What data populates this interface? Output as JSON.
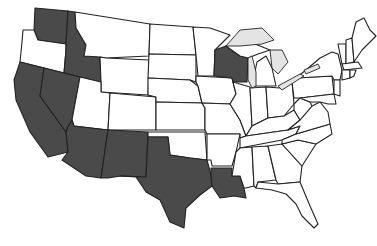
{
  "map": {
    "title": "",
    "colors": {
      "highlighted": "#4a4a4a",
      "default": "#ffffff",
      "border": "#222222",
      "lakes": "#e4e4e4"
    },
    "highlighted_states": [
      "Washington",
      "Idaho",
      "California",
      "Nevada",
      "Arizona",
      "New Mexico",
      "Texas",
      "Louisiana",
      "Wisconsin"
    ],
    "states": [
      {
        "id": "WA",
        "name": "Washington",
        "highlighted": true,
        "points": "35,8 68,11 66,44 38,40 34,30"
      },
      {
        "id": "OR",
        "name": "Oregon",
        "highlighted": false,
        "points": "23,30 34,30 38,40 66,44 66,50 64,73 20,62 22,42"
      },
      {
        "id": "ID",
        "name": "Idaho",
        "highlighted": true,
        "points": "68,11 75,12 76,28 86,45 84,56 100,57 101,82 64,73 66,50 66,44"
      },
      {
        "id": "MT",
        "name": "Montana",
        "highlighted": false,
        "points": "75,12 150,24 149,56 106,58 100,57 84,56 86,45 76,28"
      },
      {
        "id": "WY",
        "name": "Wyoming",
        "highlighted": false,
        "points": "106,58 149,60 148,95 101,92 101,82 100,57"
      },
      {
        "id": "CA",
        "name": "California",
        "highlighted": true,
        "points": "20,62 44,68 40,96 66,132 68,152 48,157 30,132 16,100 14,80"
      },
      {
        "id": "NV",
        "name": "Nevada",
        "highlighted": true,
        "points": "44,68 80,77 72,120 68,127 66,132 40,96"
      },
      {
        "id": "UT",
        "name": "Utah",
        "highlighted": false,
        "points": "80,77 101,82 101,92 110,93 108,130 74,126 72,120"
      },
      {
        "id": "CO",
        "name": "Colorado",
        "highlighted": false,
        "points": "110,93 156,97 156,130 108,130"
      },
      {
        "id": "AZ",
        "name": "Arizona",
        "highlighted": true,
        "points": "74,126 108,130 101,178 86,176 62,160 68,152 66,132 68,127 72,120"
      },
      {
        "id": "NM",
        "name": "New Mexico",
        "highlighted": true,
        "points": "108,130 148,132 146,177 121,176 108,178 101,178"
      },
      {
        "id": "ND",
        "name": "North Dakota",
        "highlighted": false,
        "points": "150,24 193,27 196,55 149,54"
      },
      {
        "id": "SD",
        "name": "South Dakota",
        "highlighted": false,
        "points": "149,54 196,55 196,82 190,80 148,78"
      },
      {
        "id": "NE",
        "name": "Nebraska",
        "highlighted": false,
        "points": "148,78 190,80 198,86 202,103 156,102 156,97 148,95"
      },
      {
        "id": "KS",
        "name": "Kansas",
        "highlighted": false,
        "points": "156,102 202,103 205,108 205,130 156,130"
      },
      {
        "id": "OK",
        "name": "Oklahoma",
        "highlighted": false,
        "points": "148,132 205,132 207,160 190,158 170,155 168,137 148,137"
      },
      {
        "id": "TX",
        "name": "Texas",
        "highlighted": true,
        "points": "148,137 168,137 170,155 190,158 207,160 211,175 212,186 200,195 186,208 184,228 170,222 160,200 146,192 136,177 121,176 146,177"
      },
      {
        "id": "MN",
        "name": "Minnesota",
        "highlighted": false,
        "points": "193,27 210,28 230,35 215,50 214,76 198,76 196,55"
      },
      {
        "id": "IA",
        "name": "Iowa",
        "highlighted": false,
        "points": "196,76 232,78 236,94 230,104 202,103 198,86 196,82"
      },
      {
        "id": "MO",
        "name": "Missouri",
        "highlighted": false,
        "points": "202,103 230,104 240,120 246,136 240,138 240,134 207,134 205,130 205,108"
      },
      {
        "id": "AR",
        "name": "Arkansas",
        "highlighted": false,
        "points": "207,134 240,134 236,152 232,166 212,166 211,160 207,160"
      },
      {
        "id": "LA",
        "name": "Louisiana",
        "highlighted": true,
        "points": "211,168 232,168 232,176 240,176 244,188 246,198 234,196 220,198 212,186 211,175"
      },
      {
        "id": "WI",
        "name": "Wisconsin",
        "highlighted": true,
        "points": "215,50 226,46 240,56 248,58 247,82 233,82 232,78 214,76"
      },
      {
        "id": "IL",
        "name": "Illinois",
        "highlighted": false,
        "points": "233,82 250,87 252,126 246,136 240,120 230,104 236,94"
      },
      {
        "id": "MI",
        "name": "Michigan",
        "highlighted": false,
        "points": "252,86 257,62 266,56 272,68 276,86"
      },
      {
        "id": "MI_UP",
        "name": "Michigan (Upper)",
        "highlighted": false,
        "points": "226,46 240,40 255,44 270,50 258,54 248,58 240,56"
      },
      {
        "id": "IN",
        "name": "Indiana",
        "highlighted": false,
        "points": "250,88 266,87 268,118 252,126"
      },
      {
        "id": "OH",
        "name": "Ohio",
        "highlighted": false,
        "points": "266,87 280,88 292,82 294,104 284,116 268,118"
      },
      {
        "id": "KY",
        "name": "Kentucky",
        "highlighted": false,
        "points": "252,126 268,118 284,116 294,110 300,120 288,130 246,136"
      },
      {
        "id": "TN",
        "name": "Tennessee",
        "highlighted": false,
        "points": "240,138 246,136 288,130 300,126 296,134 282,140 240,148"
      },
      {
        "id": "MS",
        "name": "Mississippi",
        "highlighted": false,
        "points": "240,148 252,147 254,186 246,188 244,188 240,176 232,176 236,152"
      },
      {
        "id": "AL",
        "name": "Alabama",
        "highlighted": false,
        "points": "252,147 268,146 276,180 258,182 256,188 254,186"
      },
      {
        "id": "GA",
        "name": "Georgia",
        "highlighted": false,
        "points": "268,146 282,144 302,166 300,182 278,184 276,180"
      },
      {
        "id": "FL",
        "name": "Florida",
        "highlighted": false,
        "points": "256,188 258,182 278,184 300,182 310,206 318,224 314,228 302,216 296,204 286,194 272,190"
      },
      {
        "id": "SC",
        "name": "South Carolina",
        "highlighted": false,
        "points": "282,144 298,140 316,144 302,166"
      },
      {
        "id": "NC",
        "name": "North Carolina",
        "highlighted": false,
        "points": "282,140 296,134 330,124 332,134 316,144 298,140 282,144"
      },
      {
        "id": "VA",
        "name": "Virginia",
        "highlighted": false,
        "points": "288,130 300,120 312,106 320,102 328,112 330,124 296,134 300,126"
      },
      {
        "id": "WV",
        "name": "West Virginia",
        "highlighted": false,
        "points": "294,104 300,98 310,102 312,106 300,120 294,110"
      },
      {
        "id": "PA",
        "name": "Pennsylvania",
        "highlighted": false,
        "points": "292,82 296,78 332,76 334,94 300,98 294,98"
      },
      {
        "id": "NY",
        "name": "New York",
        "highlighted": false,
        "points": "296,78 306,70 320,58 332,52 338,54 342,70 340,80 334,80 332,76"
      },
      {
        "id": "NJ",
        "name": "New Jersey",
        "highlighted": false,
        "points": "334,80 340,80 340,96 334,94"
      },
      {
        "id": "MD",
        "name": "Maryland",
        "highlighted": false,
        "points": "300,98 334,94 336,104 328,104 320,102 310,102"
      },
      {
        "id": "VT",
        "name": "Vermont",
        "highlighted": false,
        "points": "338,44 346,44 346,64 342,64"
      },
      {
        "id": "NH",
        "name": "New Hampshire",
        "highlighted": false,
        "points": "346,40 352,38 354,62 346,64"
      },
      {
        "id": "ME",
        "name": "Maine",
        "highlighted": false,
        "points": "352,38 356,22 364,18 370,30 376,36 362,50 354,62"
      },
      {
        "id": "MA",
        "name": "Massachusetts",
        "highlighted": false,
        "points": "342,64 358,62 362,68 344,70"
      },
      {
        "id": "CT",
        "name": "Connecticut",
        "highlighted": false,
        "points": "342,70 350,70 350,78 342,80"
      },
      {
        "id": "RI",
        "name": "Rhode Island",
        "highlighted": false,
        "points": "350,70 356,70 354,76 350,78"
      }
    ],
    "lakes": [
      {
        "name": "Lake Superior",
        "points": "226,46 240,30 262,28 274,40 262,44 240,46"
      },
      {
        "name": "Lake Michigan",
        "points": "248,58 252,56 256,72 256,86 252,88 248,80"
      },
      {
        "name": "Lake Huron",
        "points": "270,50 282,50 288,62 278,74 272,68"
      },
      {
        "name": "Lake Erie",
        "points": "278,86 300,74 304,76 282,90"
      },
      {
        "name": "Lake Ontario",
        "points": "304,70 318,64 320,68 306,74"
      }
    ]
  }
}
